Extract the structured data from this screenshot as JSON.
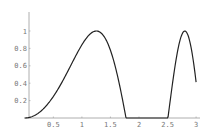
{
  "chart_data": {
    "type": "line",
    "title": "",
    "xlabel": "",
    "ylabel": "",
    "function": "sin(x^2), shown only where >= 0",
    "xlim": [
      0,
      3
    ],
    "ylim": [
      0,
      1.1
    ],
    "grid": false,
    "legend": null,
    "x_ticks": [
      "0.5",
      "1",
      "1.5",
      "2",
      "2.5",
      "3"
    ],
    "y_ticks": [
      "0.2",
      "0.4",
      "0.6",
      "0.8",
      "1"
    ],
    "series": [
      {
        "name": "curve",
        "color": "#222222",
        "x": [
          0,
          0.25,
          0.5,
          0.75,
          1.0,
          1.1,
          1.2533,
          1.4,
          1.5,
          1.6,
          1.7,
          1.7725,
          2.5066,
          2.6,
          2.7,
          2.802,
          2.9,
          3.0
        ],
        "y": [
          0,
          0.062,
          0.247,
          0.534,
          0.841,
          0.936,
          1.0,
          0.925,
          0.778,
          0.549,
          0.255,
          0,
          0,
          0.443,
          0.831,
          1.0,
          0.855,
          0.412
        ]
      }
    ]
  },
  "axes": {
    "color": "#888888"
  }
}
